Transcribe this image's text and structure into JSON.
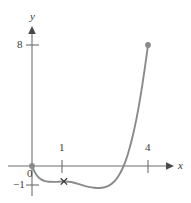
{
  "figure": {
    "name": "function-graph",
    "background_color": "#ffffff",
    "axis_color": "#6e6e6e",
    "curve_color": "#8a8a8a",
    "text_color": "#3a3a3a",
    "point_color": "#8a8a8a"
  },
  "axes": {
    "x_axis_label": "x",
    "y_axis_label": "y",
    "origin_label": "0"
  },
  "ticks": {
    "y": [
      {
        "label": "8",
        "value": 8
      },
      {
        "label": "−1",
        "value": -1
      }
    ],
    "x": [
      {
        "label": "1",
        "value": 1
      },
      {
        "label": "4",
        "value": 4
      }
    ]
  },
  "markers": {
    "cross_label": "×"
  },
  "chart_data": {
    "type": "line",
    "title": "",
    "xlabel": "x",
    "ylabel": "y",
    "xlim": [
      -0.3,
      4.8
    ],
    "ylim": [
      -1.6,
      9.2
    ],
    "grid": false,
    "legend": null,
    "x_ticks": [
      1,
      4
    ],
    "x_tick_labels": [
      "1",
      "4"
    ],
    "y_ticks": [
      -1,
      8
    ],
    "y_tick_labels": [
      "−1",
      "8"
    ],
    "series": [
      {
        "name": "curve",
        "color": "#8a8a8a",
        "x": [
          0.0,
          0.1,
          0.2,
          0.3,
          0.45,
          0.6,
          0.8,
          1.0,
          1.15,
          1.35,
          1.55,
          1.75,
          1.95,
          2.15,
          2.35,
          2.55,
          2.75,
          2.95,
          3.15,
          3.3,
          3.45,
          3.6,
          3.75,
          3.9,
          4.0
        ],
        "y": [
          0.0,
          -0.42,
          -0.7,
          -0.87,
          -1.0,
          -1.04,
          -1.05,
          -1.03,
          -1.02,
          -1.06,
          -1.16,
          -1.28,
          -1.38,
          -1.44,
          -1.45,
          -1.38,
          -1.18,
          -0.76,
          -0.05,
          0.75,
          1.8,
          3.1,
          4.7,
          6.6,
          8.0
        ]
      }
    ],
    "points": [
      {
        "name": "origin-point",
        "x": 0,
        "y": 0,
        "style": "filled-dot"
      },
      {
        "name": "endpoint",
        "x": 4,
        "y": 8,
        "style": "filled-dot"
      }
    ],
    "annotations": [
      {
        "name": "cross-marker",
        "text": "×",
        "x": 1.1,
        "y": -1.02
      }
    ]
  }
}
